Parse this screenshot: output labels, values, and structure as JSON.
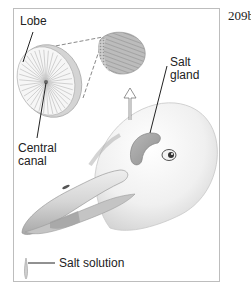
{
  "figure": {
    "page_number": "209b",
    "labels": {
      "lobe": "Lobe",
      "central_canal_line1": "Central",
      "central_canal_line2": "canal",
      "salt_gland_line1": "Salt",
      "salt_gland_line2": "gland",
      "salt_solution": "Salt solution"
    },
    "colors": {
      "frame": "#bdbdbd",
      "ink": "#222222",
      "gland_fill": "#a9a9a9",
      "head_shade": "#e6e6e6",
      "beak_fill": "#cfcfcf"
    }
  }
}
